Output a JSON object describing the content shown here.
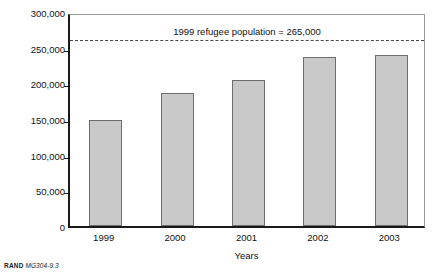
{
  "chart_data": {
    "type": "bar",
    "title": "",
    "xlabel": "Years",
    "ylabel": "Total number of returned refugees",
    "categories": [
      "1999",
      "2000",
      "2001",
      "2002",
      "2003"
    ],
    "values": [
      148000,
      187000,
      205000,
      237000,
      240000
    ],
    "ylim": [
      0,
      300000
    ],
    "yticks": [
      0,
      50000,
      100000,
      150000,
      200000,
      250000,
      300000
    ],
    "ytick_labels": [
      "0",
      "50,000",
      "100,000",
      "150,000",
      "200,000",
      "250,000",
      "300,000"
    ],
    "grid": false,
    "legend": "none",
    "bar_color": "#c9c9c9",
    "bar_border_color": "#6e6e6e",
    "axis_color": "#1a1a1a",
    "annotations": [
      {
        "name": "refugee-population-reference",
        "text": "1999 refugee population = 265,000",
        "value": 265000,
        "style": "dashed-horizontal-line",
        "color": "#4a4a4a"
      }
    ]
  },
  "footer": {
    "brand": "RAND",
    "code": "MG304-9.3"
  }
}
